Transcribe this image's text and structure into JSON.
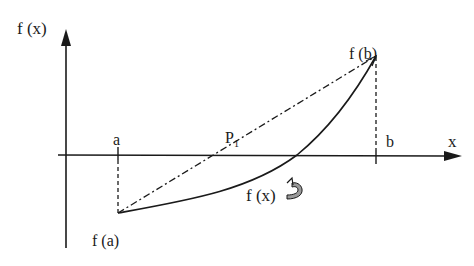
{
  "figure": {
    "type": "secant/false-position method illustration",
    "labels": {
      "y_axis": "f (x)",
      "x_axis": "x",
      "a": "a",
      "b": "b",
      "fa": "f (a)",
      "fb": "f (b)",
      "p1": "P",
      "p1_sub": "1",
      "curve": "f (x)"
    },
    "elements": {
      "y_axis": {
        "x": 66,
        "y_top": 30,
        "y_bottom": 248
      },
      "x_axis": {
        "y": 155,
        "x_left": 58,
        "x_right": 462
      },
      "point_a": {
        "x": 118,
        "fy": 213
      },
      "point_b": {
        "x": 376,
        "fy": 56
      },
      "chord_root_P1": {
        "x": 232,
        "y": 155
      },
      "curve_root": {
        "x": 297,
        "y": 155
      }
    },
    "colors": {
      "line": "#1a1a1a",
      "arrow_fill": "#9a9a9a",
      "background": "#ffffff"
    }
  }
}
